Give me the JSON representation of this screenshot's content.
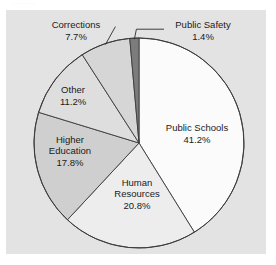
{
  "figure": {
    "background_color": "#ffffff",
    "panel_color": "#e3e3e3",
    "outline_color": "#3c3c3c",
    "artifact_text": "· ·        ···   ··· ··"
  },
  "chart_data": {
    "type": "pie",
    "title": "",
    "subtitle": "",
    "xlabel": "",
    "ylabel": "",
    "legend": "none",
    "grid": false,
    "labels_show_percent": true,
    "start_angle_deg": 90,
    "direction": "clockwise",
    "categories": [
      "Public Schools",
      "Human Resources",
      "Higher Education",
      "Other",
      "Corrections",
      "Public Safety"
    ],
    "values": [
      41.2,
      20.8,
      17.8,
      11.2,
      7.7,
      1.4
    ],
    "units": "percent",
    "slices": [
      {
        "label": "Public Schools",
        "value": 41.2,
        "value_text": "41.2%",
        "color": "#fbfbfb",
        "label_lines": [
          "Public Schools",
          "41.2%"
        ],
        "label_x": 197,
        "label_y": 134,
        "callout": false
      },
      {
        "label": "Human Resources",
        "value": 20.8,
        "value_text": "20.8%",
        "color": "#ededed",
        "label_lines": [
          "Human",
          "Resources",
          "20.8%"
        ],
        "label_x": 137,
        "label_y": 194,
        "callout": false
      },
      {
        "label": "Higher Education",
        "value": 17.8,
        "value_text": "17.8%",
        "color": "#cfcfcf",
        "label_lines": [
          "Higher",
          "Education",
          "17.8%"
        ],
        "label_x": 70,
        "label_y": 151,
        "callout": false
      },
      {
        "label": "Other",
        "value": 11.2,
        "value_text": "11.2%",
        "color": "#dedede",
        "label_lines": [
          "Other",
          "11.2%"
        ],
        "label_x": 73,
        "label_y": 96,
        "callout": false
      },
      {
        "label": "Corrections",
        "value": 7.7,
        "value_text": "7.7%",
        "color": "#d6d6d6",
        "label_lines": [
          "Corrections",
          "7.7%"
        ],
        "label_x": 76,
        "label_y": 31,
        "callout": true
      },
      {
        "label": "Public Safety",
        "value": 1.4,
        "value_text": "1.4%",
        "color": "#7c7c7c",
        "label_lines": [
          "Public Safety",
          "1.4%"
        ],
        "label_x": 203,
        "label_y": 31,
        "callout": true
      }
    ],
    "geometry": {
      "center_x": 139,
      "center_y": 143,
      "radius": 105
    }
  }
}
